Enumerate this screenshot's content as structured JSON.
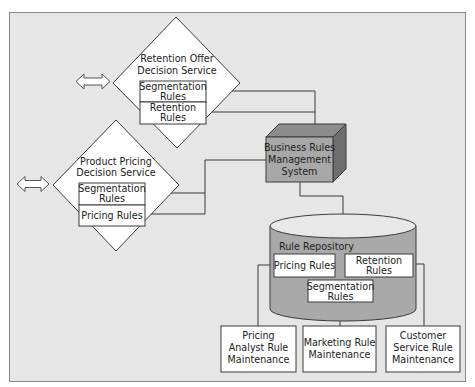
{
  "diagram": {
    "retention_service": {
      "title_line1": "Retention Offer",
      "title_line2": "Decision Service",
      "box1_line1": "Segmentation",
      "box1_line2": "Rules",
      "box2_line1": "Retention",
      "box2_line2": "Rules"
    },
    "pricing_service": {
      "title_line1": "Product Pricing",
      "title_line2": "Decision Service",
      "box1_line1": "Segmentation",
      "box1_line2": "Rules",
      "box2_line1": "Pricing Rules"
    },
    "brms": {
      "line1": "Business Rules",
      "line2": "Management",
      "line3": "System"
    },
    "repository": {
      "title": "Rule Repository",
      "pricing_rules": "Pricing Rules",
      "retention_line1": "Retention",
      "retention_line2": "Rules",
      "segmentation_line1": "Segmentation",
      "segmentation_line2": "Rules"
    },
    "maintenance": [
      {
        "line1": "Pricing",
        "line2": "Analyst Rule",
        "line3": "Maintenance"
      },
      {
        "line1": "Marketing Rule",
        "line2": "Maintenance"
      },
      {
        "line1": "Customer",
        "line2": "Service Rule",
        "line3": "Maintenance"
      }
    ],
    "icons": [
      "double-arrow-icon",
      "double-arrow-icon"
    ],
    "colors": {
      "frame_bg": "#e6e6e6",
      "brms_front": "#a8a8a8",
      "brms_top": "#8c8c8c",
      "brms_side": "#6e6e6e",
      "cylinder_body": "#a9a9a9",
      "cylinder_top": "#e8e8e8"
    }
  }
}
